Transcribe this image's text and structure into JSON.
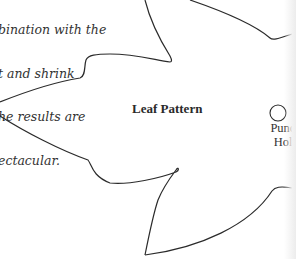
{
  "instructions": {
    "lines": [
      "bination with the",
      "t and shrink",
      "he results are",
      "ectacular."
    ]
  },
  "pattern": {
    "title": "Leaf Pattern",
    "punch_hole_label_line1": "Punch",
    "punch_hole_label_line2": "Hole"
  },
  "colors": {
    "outline": "#2b2b2b",
    "text": "#333333"
  }
}
